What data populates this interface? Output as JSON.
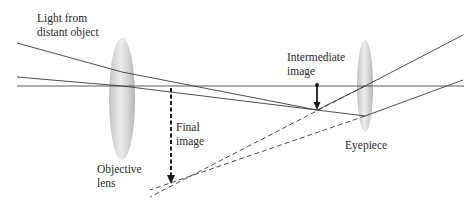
{
  "labels": {
    "light_source_line1": "Light from",
    "light_source_line2": "distant object",
    "intermediate_line1": "Intermediate",
    "intermediate_line2": "image",
    "final_line1": "Final",
    "final_line2": "image",
    "objective_line1": "Objective",
    "objective_line2": "lens",
    "eyepiece": "Eyepiece"
  },
  "colors": {
    "ray": "#3a3a3a",
    "lens_light": "#f2f2f2",
    "lens_dark": "#b8b8b8",
    "text": "#2a2a2a"
  },
  "geometry": {
    "optical_axis_y": 86,
    "objective_lens": {
      "cx": 122,
      "cy": 99,
      "rx": 13,
      "ry": 61
    },
    "eyepiece": {
      "cx": 365,
      "cy": 86,
      "rx": 8,
      "ry": 46
    },
    "intermediate_image": {
      "x": 317,
      "top": 85,
      "bottom": 110
    },
    "final_image": {
      "x": 171,
      "top": 88,
      "bottom": 183
    }
  }
}
